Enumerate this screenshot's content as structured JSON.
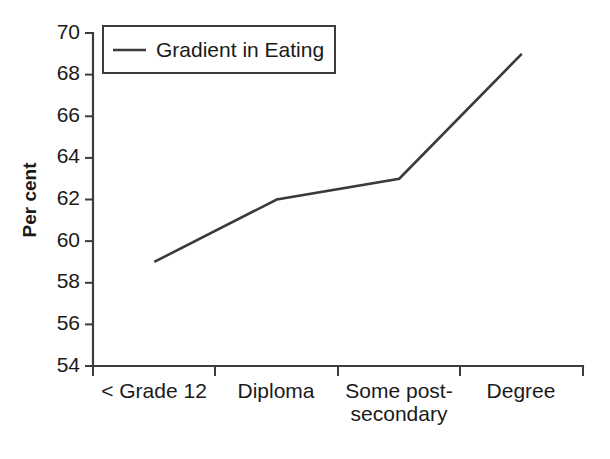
{
  "chart_data": {
    "type": "line",
    "title": "",
    "subtitle": "",
    "xlabel": "",
    "ylabel": "Per cent",
    "categories": [
      "< Grade 12",
      "Diploma",
      "Some post-secondary",
      "Degree"
    ],
    "category_lines": [
      [
        "< Grade 12"
      ],
      [
        "Diploma"
      ],
      [
        "Some post-",
        "secondary"
      ],
      [
        "Degree"
      ]
    ],
    "series": [
      {
        "name": "Gradient in Eating",
        "values": [
          59,
          62,
          63,
          69
        ],
        "color": "#3a3a3a"
      }
    ],
    "ylim": [
      54,
      70
    ],
    "yticks": [
      54,
      56,
      58,
      60,
      62,
      64,
      66,
      68,
      70
    ],
    "ytick_labels": [
      "54",
      "56",
      "58",
      "60",
      "62",
      "64",
      "66",
      "68",
      "70"
    ],
    "grid": false,
    "legend": {
      "position": "top-left",
      "entries": [
        {
          "label": "Gradient in Eating",
          "color": "#3a3a3a",
          "marker": "line"
        }
      ]
    },
    "axis_color": "#3c3c3c",
    "background_color": "#ffffff"
  }
}
